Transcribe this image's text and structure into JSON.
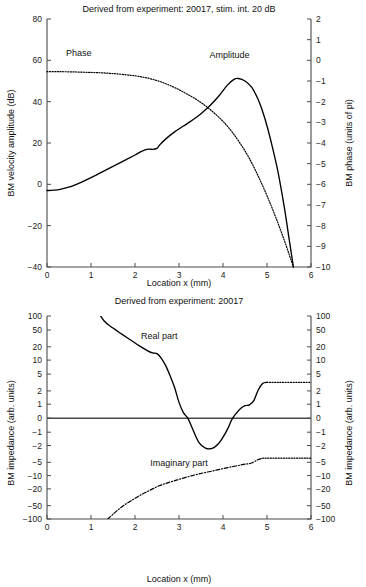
{
  "figure": {
    "panels": [
      {
        "id": "top",
        "title": "Derived from experiment: 20017, stim. int. 20 dB",
        "xlabel": "Location x (mm)",
        "ylabel_left": "BM velocity amplitude (dB)",
        "ylabel_right": "BM phase (units of pi)",
        "annotations": [
          {
            "text": "Phase",
            "x": 0.72,
            "y": 62
          },
          {
            "text": "Amplitude",
            "x": 4.15,
            "y": 61
          }
        ]
      },
      {
        "id": "bottom",
        "title": "Derived from experiment: 20017",
        "xlabel": "Location x (mm)",
        "ylabel_left": "BM impedance (arb. units)",
        "ylabel_right": "BM impedance (arb. units)",
        "annotations": [
          {
            "text": "Real part",
            "x": 2.55,
            "y": 30
          },
          {
            "text": "Imaginary part",
            "x": 3.0,
            "y": -6.1
          }
        ]
      }
    ]
  },
  "chart_data": [
    {
      "type": "line",
      "id": "bm-velocity-and-phase",
      "title": "Derived from experiment: 20017, stim. int. 20 dB",
      "xlabel": "Location x (mm)",
      "ylabel": "BM velocity amplitude (dB)",
      "ylabel_right": "BM phase (units of pi)",
      "xlim": [
        0,
        6
      ],
      "ylim": [
        -40,
        80
      ],
      "ylim_right": [
        -10,
        2
      ],
      "xticks": [
        0,
        1,
        2,
        3,
        4,
        5,
        6
      ],
      "yticks": [
        -40,
        -20,
        0,
        20,
        40,
        60,
        80
      ],
      "yticks_right": [
        -10,
        -9,
        -8,
        -7,
        -6,
        -5,
        -4,
        -3,
        -2,
        -1,
        0,
        1,
        2
      ],
      "grid": false,
      "legend": "inline-annotations",
      "series": [
        {
          "name": "Amplitude",
          "style": "solid",
          "axis": "left",
          "x": [
            0.0,
            0.15,
            0.3,
            0.45,
            0.6,
            0.8,
            1.0,
            1.2,
            1.4,
            1.6,
            1.8,
            2.0,
            2.15,
            2.3,
            2.4,
            2.5,
            2.55,
            2.7,
            2.9,
            3.1,
            3.3,
            3.5,
            3.7,
            3.9,
            4.1,
            4.25,
            4.35,
            4.5,
            4.65,
            4.8,
            4.95,
            5.1,
            5.25,
            5.4,
            5.5,
            5.6
          ],
          "y": [
            -3.0,
            -2.8,
            -2.4,
            -1.6,
            -0.6,
            1.2,
            3.2,
            5.4,
            7.6,
            9.8,
            12.0,
            14.2,
            16.0,
            17.0,
            16.9,
            17.4,
            18.8,
            22.0,
            25.4,
            28.2,
            31.0,
            34.2,
            38.0,
            42.6,
            48.0,
            50.8,
            51.2,
            50.0,
            47.0,
            41.0,
            32.0,
            20.0,
            6.0,
            -12.0,
            -26.0,
            -40.0
          ]
        },
        {
          "name": "Phase",
          "style": "dotted",
          "axis": "right",
          "x": [
            0.0,
            0.3,
            0.6,
            0.9,
            1.2,
            1.5,
            1.8,
            2.0,
            2.2,
            2.4,
            2.6,
            2.8,
            3.0,
            3.2,
            3.4,
            3.6,
            3.8,
            4.0,
            4.2,
            4.4,
            4.6,
            4.8,
            5.0,
            5.2,
            5.4,
            5.6
          ],
          "y": [
            -0.55,
            -0.55,
            -0.56,
            -0.58,
            -0.6,
            -0.64,
            -0.7,
            -0.75,
            -0.82,
            -0.92,
            -1.05,
            -1.22,
            -1.42,
            -1.65,
            -1.9,
            -2.2,
            -2.55,
            -2.95,
            -3.45,
            -4.05,
            -4.75,
            -5.6,
            -6.55,
            -7.6,
            -8.75,
            -10.0
          ]
        }
      ]
    },
    {
      "type": "line",
      "id": "bm-impedance",
      "title": "Derived from experiment: 20017",
      "xlabel": "Location x (mm)",
      "ylabel": "BM impedance (arb. units)",
      "ylabel_right": "BM impedance (arb. units)",
      "xlim": [
        0,
        6
      ],
      "yscale": "symlog",
      "ylim": [
        -100,
        100
      ],
      "xticks": [
        0,
        1,
        2,
        3,
        4,
        5,
        6
      ],
      "yticks": [
        100,
        50,
        20,
        10,
        5,
        2,
        1,
        0,
        -1,
        -2,
        -5,
        -10,
        -20,
        -50,
        -100
      ],
      "grid": false,
      "legend": "inline-annotations",
      "series": [
        {
          "name": "Real part",
          "style": "solid",
          "x": [
            1.1,
            1.3,
            1.5,
            1.7,
            1.9,
            2.1,
            2.3,
            2.4,
            2.5,
            2.6,
            2.7,
            2.8,
            2.9,
            3.0,
            3.1,
            3.2,
            3.3,
            3.45,
            3.6,
            3.75,
            3.9,
            4.0,
            4.1,
            4.2,
            4.3,
            4.4,
            4.5,
            4.6,
            4.7,
            4.8,
            4.9,
            5.0
          ],
          "y": [
            110,
            78,
            55,
            40,
            29,
            21,
            16,
            14.5,
            14,
            11,
            7.5,
            4.5,
            2.4,
            1.1,
            0.4,
            0.0,
            -0.7,
            -1.7,
            -2.3,
            -2.35,
            -1.8,
            -1.3,
            -0.8,
            -0.1,
            0.35,
            0.7,
            0.9,
            0.95,
            1.2,
            2.1,
            3.0,
            3.2
          ],
          "tail_style": "dotted",
          "tail_x": [
            5.0,
            6.0
          ],
          "tail_y": [
            3.2,
            3.2
          ]
        },
        {
          "name": "Imaginary part",
          "style": "dashdot",
          "x": [
            1.38,
            1.5,
            1.65,
            1.8,
            1.95,
            2.1,
            2.25,
            2.4,
            2.55,
            2.7,
            2.85,
            3.0,
            3.15,
            3.3,
            3.45,
            3.6,
            3.75,
            3.9,
            4.05,
            4.2,
            4.35,
            4.5,
            4.65,
            4.8,
            4.9
          ],
          "y": [
            -105,
            -78,
            -58,
            -45,
            -36,
            -29,
            -24,
            -20,
            -17,
            -15,
            -13.5,
            -12.2,
            -11.0,
            -10.0,
            -9.2,
            -8.5,
            -7.9,
            -7.3,
            -6.8,
            -6.3,
            -5.9,
            -5.5,
            -5.2,
            -4.3,
            -4.0
          ],
          "tail_style": "dotted",
          "tail_x": [
            4.9,
            6.0
          ],
          "tail_y": [
            -4.0,
            -4.0
          ]
        }
      ]
    }
  ]
}
